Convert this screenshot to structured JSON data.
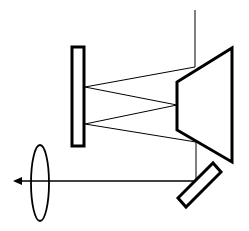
{
  "diagram": {
    "type": "optical-beam-path",
    "stroke_color": "#000000",
    "background": "#ffffff",
    "elements": {
      "flat_mirror": {
        "x": 72,
        "y": 47,
        "width": 12,
        "height": 99
      },
      "concave_mirror_trapezoid": {
        "points": "232,48 232,162 177,130 177,82"
      },
      "input_line": {
        "x1": 195,
        "y1": 10,
        "x2": 195,
        "y2": 67
      },
      "rays": [
        {
          "x1": 195,
          "y1": 67,
          "x2": 85,
          "y2": 87
        },
        {
          "x1": 85,
          "y1": 87,
          "x2": 177,
          "y2": 105
        },
        {
          "x1": 177,
          "y1": 105,
          "x2": 85,
          "y2": 124
        },
        {
          "x1": 85,
          "y1": 124,
          "x2": 196,
          "y2": 142
        }
      ],
      "down_line": {
        "x1": 196,
        "y1": 142,
        "x2": 196,
        "y2": 181
      },
      "output_beam": {
        "x1": 196,
        "y1": 181,
        "x2": 20,
        "y2": 181
      },
      "arrow_head": {
        "points": "13,181 22,177 22,185"
      },
      "fold_mirror": {
        "points": "178,198 186,207 221,172 213,163"
      },
      "lens": {
        "cx": 40,
        "cy": 183,
        "rx": 9,
        "ry": 38
      }
    }
  }
}
